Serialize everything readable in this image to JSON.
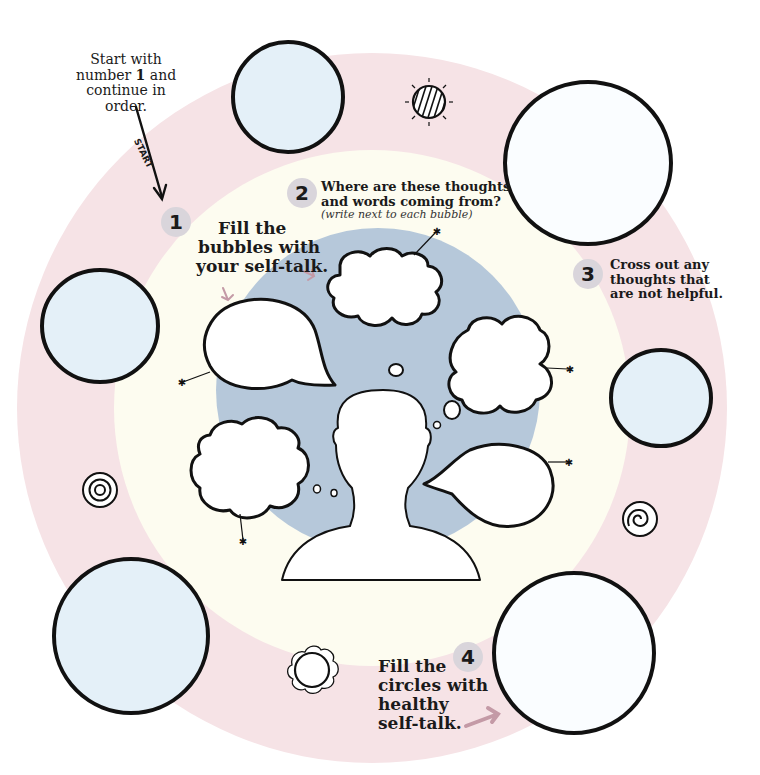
{
  "colors": {
    "outer_ring": "#f6e3e6",
    "middle_ring": "#fdfcf0",
    "inner_disc": "#b6c8da",
    "circle_fill": "#e4f0f8",
    "ink": "#111111",
    "step_badge": "#d9d5db",
    "pointer_arrow": "#c49aa6"
  },
  "intro": {
    "line1": "Start with",
    "line2_pre": "number ",
    "line2_num": "1",
    "line2_post": " and",
    "line3": "continue in",
    "line4": "order.",
    "arrow_label": "START"
  },
  "steps": [
    {
      "number": "1",
      "lines": [
        "Fill the",
        "bubbles with",
        "your self-talk."
      ]
    },
    {
      "number": "2",
      "lines": [
        "Where are these thoughts",
        "and words coming from?"
      ],
      "note": "(write next to each bubble)"
    },
    {
      "number": "3",
      "lines": [
        "Cross out any",
        "thoughts that",
        "are not helpful."
      ]
    },
    {
      "number": "4",
      "lines": [
        "Fill the",
        "circles with",
        "healthy",
        "self-talk."
      ]
    }
  ],
  "icons": [
    {
      "name": "striped-sun-icon"
    },
    {
      "name": "concentric-circles-icon"
    },
    {
      "name": "spiral-icon"
    },
    {
      "name": "scalloped-flower-icon"
    }
  ],
  "circles": [
    {
      "name": "top-left-circle"
    },
    {
      "name": "top-right-circle"
    },
    {
      "name": "left-circle"
    },
    {
      "name": "right-circle"
    },
    {
      "name": "bottom-left-circle"
    },
    {
      "name": "bottom-right-circle"
    }
  ],
  "bubbles": [
    {
      "name": "top-thought-bubble"
    },
    {
      "name": "left-speech-bubble"
    },
    {
      "name": "right-thought-bubble"
    },
    {
      "name": "lower-left-thought-bubble"
    },
    {
      "name": "lower-right-speech-bubble"
    }
  ]
}
